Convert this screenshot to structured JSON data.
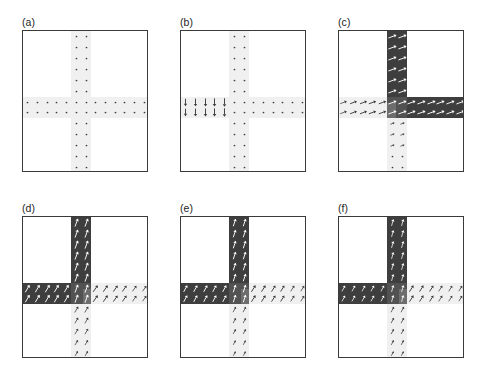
{
  "figure": {
    "type": "multi-panel-vector-field",
    "caption_labels": [
      "(a)",
      "(b)",
      "(c)",
      "(d)",
      "(e)",
      "(f)"
    ],
    "panel_count": 6,
    "grid": {
      "rows": 2,
      "cols": 3
    },
    "colors": {
      "frame": "#3a3a3a",
      "dark_domain": "#3e3e3e",
      "mid_domain": "#6f6f6f",
      "junction_domain": "#565656",
      "guide_band": "#f0f0f0",
      "arrow_on_light": "#3a3a3a",
      "arrow_on_dark": "#ffffff",
      "background": "#ffffff"
    },
    "geometry": {
      "description": "cross-shaped nanowire junction: a 2-cell-wide vertical arm crossing a 2-cell-tall horizontal arm",
      "lattice_columns": 13,
      "lattice_rows": 13,
      "arm_width_cells": 2
    }
  },
  "panels": [
    {
      "id": "a",
      "label": "(a)",
      "state": "initial uniform state, no switched domain",
      "dark_bands": [],
      "arrows": {
        "vertical_arm": {
          "direction_deg": 0,
          "magnitude": 0.08,
          "note": "near-zero in-plane component, dots"
        },
        "horizontal_arm": {
          "direction_deg": 0,
          "magnitude": 0.08,
          "note": "near-zero in-plane component, dots"
        }
      }
    },
    {
      "id": "b",
      "label": "(b)",
      "state": "domain wall nucleated at left end of horizontal arm",
      "dark_bands": [],
      "arrows": {
        "horizontal_arm_left": {
          "direction_deg": 270,
          "magnitude": 1.0,
          "note": "strong downward arrows"
        },
        "horizontal_arm_right": {
          "direction_deg": 0,
          "magnitude": 0.08
        },
        "vertical_arm": {
          "direction_deg": 0,
          "magnitude": 0.08
        }
      }
    },
    {
      "id": "c",
      "label": "(c)",
      "state": "switched domain occupies upper vertical arm and right horizontal arm",
      "dark_bands": [
        "vertical-up",
        "horizontal-right"
      ],
      "arrows": {
        "vertical_up": {
          "direction_deg": 20,
          "magnitude": 1.0,
          "on_dark": true
        },
        "horizontal_right": {
          "direction_deg": 20,
          "magnitude": 1.0,
          "on_dark": true
        },
        "horizontal_left": {
          "direction_deg": 20,
          "magnitude": 0.9,
          "on_dark": false
        },
        "vertical_down": {
          "direction_deg": 20,
          "magnitude": 0.25,
          "on_dark": false
        }
      }
    },
    {
      "id": "d",
      "label": "(d)",
      "state": "switched domain occupies upper vertical arm and left horizontal arm",
      "dark_bands": [
        "vertical-up",
        "horizontal-left"
      ],
      "arrows": {
        "vertical_up": {
          "direction_deg": 70,
          "magnitude": 1.0,
          "on_dark": true
        },
        "horizontal_left": {
          "direction_deg": 60,
          "magnitude": 1.0,
          "on_dark": true
        },
        "horizontal_right": {
          "direction_deg": 55,
          "magnitude": 0.95,
          "on_dark": false
        },
        "vertical_down": {
          "direction_deg": 60,
          "magnitude": 0.75,
          "on_dark": false
        }
      }
    },
    {
      "id": "e",
      "label": "(e)",
      "state": "switched domain occupies upper vertical arm and left horizontal arm, wall relaxing",
      "dark_bands": [
        "vertical-up",
        "horizontal-left"
      ],
      "arrows": {
        "vertical_up": {
          "direction_deg": 72,
          "magnitude": 0.85,
          "on_dark": true
        },
        "horizontal_left": {
          "direction_deg": 62,
          "magnitude": 0.8,
          "on_dark": true
        },
        "horizontal_right": {
          "direction_deg": 58,
          "magnitude": 0.9,
          "on_dark": false
        },
        "vertical_down": {
          "direction_deg": 62,
          "magnitude": 0.55,
          "on_dark": false
        }
      }
    },
    {
      "id": "f",
      "label": "(f)",
      "state": "final relaxed configuration, domain wall pinned at junction",
      "dark_bands": [
        "vertical-up",
        "horizontal-left"
      ],
      "arrows": {
        "vertical_up": {
          "direction_deg": 75,
          "magnitude": 0.7,
          "on_dark": true
        },
        "horizontal_left": {
          "direction_deg": 62,
          "magnitude": 0.6,
          "on_dark": true
        },
        "horizontal_right": {
          "direction_deg": 58,
          "magnitude": 0.85,
          "on_dark": false
        },
        "vertical_down": {
          "direction_deg": 62,
          "magnitude": 0.6,
          "on_dark": false
        }
      }
    }
  ]
}
